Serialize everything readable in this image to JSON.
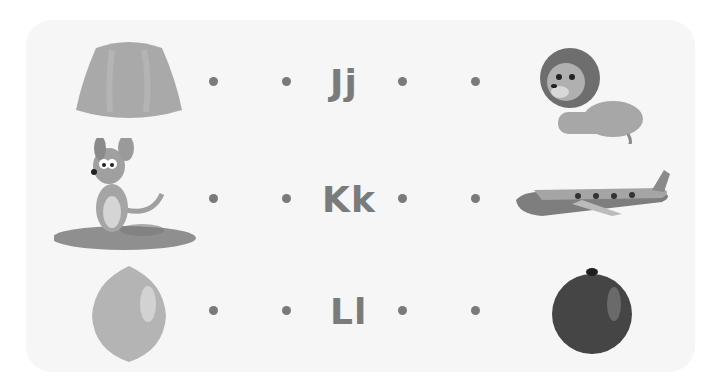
{
  "worksheet": {
    "rows": [
      {
        "letter": "Jj",
        "left_picture": "jelly-icon",
        "right_picture": "lion-icon"
      },
      {
        "letter": "Kk",
        "left_picture": "kangaroo-icon",
        "right_picture": "airplane-icon"
      },
      {
        "letter": "Ll",
        "left_picture": "lemon-icon",
        "right_picture": "orange-icon"
      }
    ]
  },
  "colors": {
    "card_background": "#f6f6f6",
    "dot": "#7a7a7a",
    "letter": "#7b7b7b"
  }
}
